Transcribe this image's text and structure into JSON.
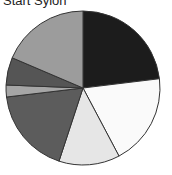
{
  "chart_data": {
    "type": "pie",
    "title": "Start Sylon",
    "start_angle_deg": 0,
    "direction": "clockwise",
    "legend": "none",
    "slices": [
      {
        "label": "",
        "value": 23.1,
        "color": "#1c1c1c"
      },
      {
        "label": "",
        "value": 19.2,
        "color": "#fafafa"
      },
      {
        "label": "",
        "value": 12.8,
        "color": "#e6e6e6"
      },
      {
        "label": "",
        "value": 18.1,
        "color": "#5c5c5c"
      },
      {
        "label": "",
        "value": 2.5,
        "color": "#a6a6a6"
      },
      {
        "label": "",
        "value": 5.8,
        "color": "#555555"
      },
      {
        "label": "",
        "value": 18.6,
        "color": "#9c9c9c"
      }
    ]
  },
  "layout": {
    "cx": 83,
    "cy": 88,
    "r": 77,
    "stroke": "#333333"
  }
}
